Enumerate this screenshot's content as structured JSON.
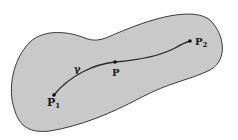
{
  "diagram": {
    "region_fill": "#c9c9c9",
    "outline_color": "#3a3a3a",
    "curve_label": "γ",
    "points": [
      {
        "id": "p1",
        "label": "P",
        "subscript": "1"
      },
      {
        "id": "p",
        "label": "P",
        "subscript": ""
      },
      {
        "id": "p2",
        "label": "P",
        "subscript": "2"
      }
    ]
  }
}
